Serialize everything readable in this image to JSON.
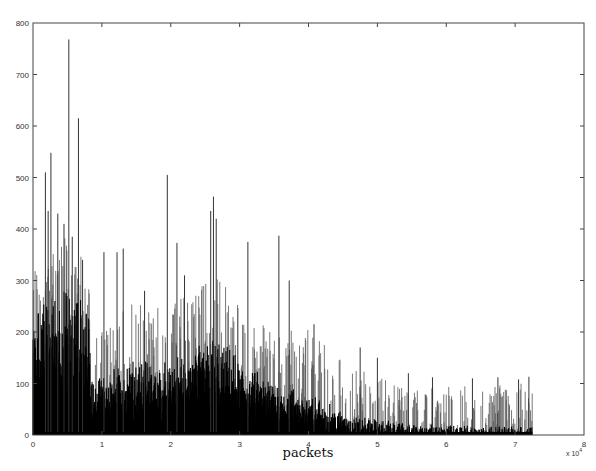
{
  "chart_data": {
    "type": "bar",
    "title": "",
    "xlabel": "packets",
    "ylabel": "",
    "x_multiplier": "x 10^4",
    "x_multiplier_text": "x 10",
    "x_multiplier_exp": "4",
    "xlim": [
      0,
      8
    ],
    "ylim": [
      0,
      800
    ],
    "x_ticks": [
      "0",
      "1",
      "2",
      "3",
      "4",
      "5",
      "6",
      "7",
      "8"
    ],
    "y_ticks": [
      "0",
      "100",
      "200",
      "300",
      "400",
      "500",
      "600",
      "700",
      "800"
    ],
    "grid": false,
    "legend": null,
    "data_range_x": [
      0,
      7.25
    ],
    "envelope": [
      {
        "x": 0.0,
        "base": 200,
        "spread": 80
      },
      {
        "x": 0.4,
        "base": 240,
        "spread": 100
      },
      {
        "x": 0.8,
        "base": 220,
        "spread": 80
      },
      {
        "x": 0.85,
        "base": 90,
        "spread": 60
      },
      {
        "x": 1.5,
        "base": 120,
        "spread": 90
      },
      {
        "x": 2.0,
        "base": 110,
        "spread": 90
      },
      {
        "x": 2.6,
        "base": 160,
        "spread": 100
      },
      {
        "x": 3.2,
        "base": 100,
        "spread": 80
      },
      {
        "x": 4.0,
        "base": 60,
        "spread": 90
      },
      {
        "x": 4.6,
        "base": 25,
        "spread": 70
      },
      {
        "x": 5.5,
        "base": 10,
        "spread": 50
      },
      {
        "x": 7.25,
        "base": 5,
        "spread": 60
      }
    ],
    "peaks": [
      {
        "x": 0.18,
        "y": 510
      },
      {
        "x": 0.22,
        "y": 435
      },
      {
        "x": 0.26,
        "y": 548
      },
      {
        "x": 0.36,
        "y": 430
      },
      {
        "x": 0.45,
        "y": 410
      },
      {
        "x": 0.52,
        "y": 768
      },
      {
        "x": 0.57,
        "y": 385
      },
      {
        "x": 0.66,
        "y": 615
      },
      {
        "x": 0.72,
        "y": 340
      },
      {
        "x": 1.03,
        "y": 355
      },
      {
        "x": 1.22,
        "y": 355
      },
      {
        "x": 1.31,
        "y": 362
      },
      {
        "x": 1.62,
        "y": 280
      },
      {
        "x": 1.95,
        "y": 505
      },
      {
        "x": 2.09,
        "y": 373
      },
      {
        "x": 2.2,
        "y": 310
      },
      {
        "x": 2.58,
        "y": 435
      },
      {
        "x": 2.62,
        "y": 463
      },
      {
        "x": 2.66,
        "y": 420
      },
      {
        "x": 3.12,
        "y": 375
      },
      {
        "x": 3.57,
        "y": 387
      },
      {
        "x": 3.72,
        "y": 300
      },
      {
        "x": 4.08,
        "y": 215
      },
      {
        "x": 4.75,
        "y": 170
      },
      {
        "x": 5.0,
        "y": 150
      },
      {
        "x": 5.45,
        "y": 120
      },
      {
        "x": 5.8,
        "y": 112
      },
      {
        "x": 6.38,
        "y": 110
      },
      {
        "x": 6.75,
        "y": 112
      },
      {
        "x": 7.05,
        "y": 108
      },
      {
        "x": 7.2,
        "y": 113
      }
    ],
    "bar_color": "#000000",
    "spike_color": "#555555"
  }
}
